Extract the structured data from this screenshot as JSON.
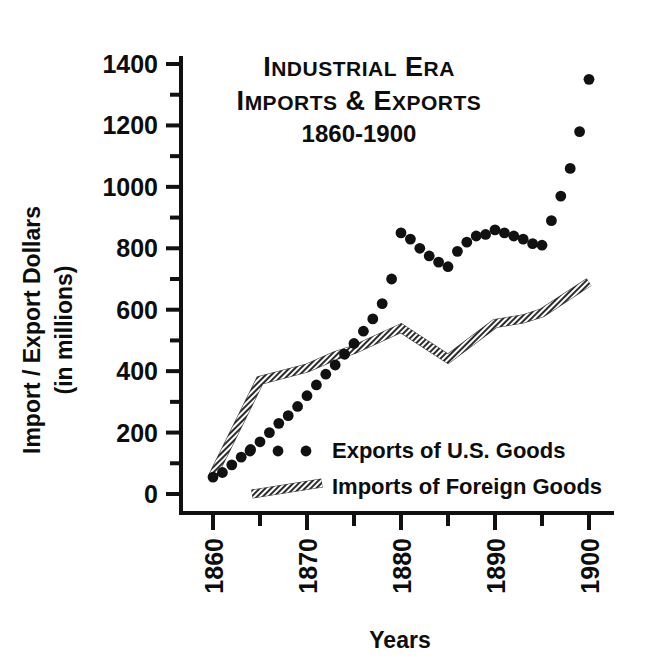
{
  "chart_data": {
    "type": "line",
    "title": "Industrial Era Imports & Exports 1860-1900",
    "title_lines": [
      "Industrial Era",
      "Imports & Exports",
      "1860-1900"
    ],
    "xlabel": "Years",
    "ylabel": "Import / Export Dollars (in millions)",
    "ylabel_lines": [
      "Import / Export Dollars",
      "(in millions)"
    ],
    "xlim": [
      1860,
      1900
    ],
    "ylim": [
      0,
      1400
    ],
    "x_tick_labels": [
      "1860",
      "1870",
      "1880",
      "1890",
      "1900"
    ],
    "x_tick_values": [
      1860,
      1870,
      1880,
      1890,
      1900
    ],
    "x_minor_tick_values": [
      1865,
      1875,
      1885,
      1895
    ],
    "y_tick_labels": [
      "0",
      "200",
      "400",
      "600",
      "800",
      "1000",
      "1200",
      "1400"
    ],
    "y_tick_values": [
      0,
      200,
      400,
      600,
      800,
      1000,
      1200,
      1400
    ],
    "y_minor_tick_values": [
      100,
      300,
      500,
      700,
      900,
      1100,
      1300
    ],
    "grid": false,
    "legend_position": "inside lower-center",
    "series": [
      {
        "name": "Exports of U.S. Goods",
        "style": "dotted",
        "color": "#111111",
        "x": [
          1860,
          1861,
          1862,
          1863,
          1864,
          1865,
          1866,
          1867,
          1868,
          1869,
          1870,
          1871,
          1872,
          1873,
          1874,
          1875,
          1876,
          1877,
          1878,
          1879,
          1880,
          1881,
          1882,
          1883,
          1884,
          1885,
          1886,
          1887,
          1888,
          1889,
          1890,
          1891,
          1892,
          1893,
          1894,
          1895,
          1896,
          1897,
          1898,
          1899,
          1900
        ],
        "values": [
          55,
          70,
          95,
          120,
          145,
          170,
          200,
          230,
          255,
          285,
          320,
          355,
          390,
          420,
          455,
          490,
          530,
          570,
          620,
          700,
          850,
          830,
          800,
          775,
          755,
          740,
          790,
          820,
          840,
          845,
          860,
          850,
          840,
          830,
          815,
          810,
          890,
          970,
          1060,
          1180,
          1350
        ]
      },
      {
        "name": "Imports of Foreign Goods",
        "style": "hatched-band",
        "color": "#6b6b6b",
        "x": [
          1860,
          1865,
          1870,
          1873,
          1875,
          1880,
          1885,
          1890,
          1893,
          1895,
          1900
        ],
        "values": [
          60,
          370,
          410,
          450,
          470,
          540,
          440,
          555,
          570,
          590,
          690
        ]
      }
    ]
  },
  "legend": {
    "items": [
      {
        "label": "Exports of U.S. Goods",
        "marker": "dots"
      },
      {
        "label": "Imports of Foreign Goods",
        "marker": "hatched-band"
      }
    ]
  }
}
